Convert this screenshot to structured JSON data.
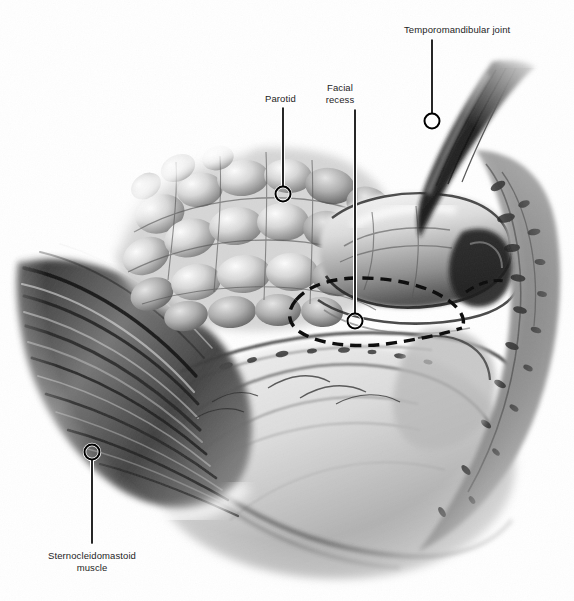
{
  "figure": {
    "style": "grayscale pencil medical illustration",
    "background_color": "#ffffff",
    "ink_color": "#1d1d1d",
    "width": 574,
    "height": 601
  },
  "labels": [
    {
      "id": "temporomandibular-joint",
      "text": "Temporomandibular joint",
      "text_x": 404,
      "text_y": 24,
      "text_align": "left",
      "leader": {
        "x1": 432,
        "y1": 40,
        "x2": 432,
        "y2": 113
      },
      "marker": {
        "cx": 432,
        "cy": 121,
        "r": 7.5
      }
    },
    {
      "id": "parotid",
      "text": "Parotid",
      "text_x": 265,
      "text_y": 93,
      "text_align": "left",
      "leader": {
        "x1": 283,
        "y1": 108,
        "x2": 283,
        "y2": 186
      },
      "marker": {
        "cx": 283,
        "cy": 194,
        "r": 7.5
      }
    },
    {
      "id": "facial-recess",
      "text": "Facial\nrecess",
      "text_x": 340,
      "text_y": 82,
      "text_align": "center",
      "leader": {
        "x1": 355,
        "y1": 110,
        "x2": 355,
        "y2": 313
      },
      "marker": {
        "cx": 355,
        "cy": 321,
        "r": 7.5
      }
    },
    {
      "id": "sternocleidomastoid-muscle",
      "text": "Sternocleidomastoid\nmuscle",
      "text_x": 92,
      "text_y": 550,
      "text_align": "center",
      "leader": {
        "x1": 92,
        "y1": 460,
        "x2": 92,
        "y2": 543
      },
      "marker": {
        "cx": 92,
        "cy": 452,
        "r": 7.5
      }
    }
  ],
  "marker_style": {
    "stroke": "#000000",
    "stroke_width": 2,
    "halo": "#ffffff",
    "halo_width": 2.5,
    "fill": "none"
  },
  "leader_style": {
    "stroke": "#000000",
    "stroke_width": 1.6,
    "halo": "#ffffff",
    "halo_width": 3
  },
  "anatomy_regions": [
    {
      "name": "parotid-gland-lobules",
      "description": "cobblestone lobulated gland, upper left-of-center"
    },
    {
      "name": "sternocleidomastoid-muscle",
      "description": "striated diagonal muscle fibers, lower left"
    },
    {
      "name": "mandibular-condyle-ramus",
      "description": "smooth rounded bone form, center-right"
    },
    {
      "name": "temporomandibular-joint-capsule",
      "description": "dark textured capsule, upper right"
    },
    {
      "name": "facial-recess-dashed-outline",
      "description": "dashed arc marking the facial recess"
    },
    {
      "name": "mastoid-tip-region",
      "description": "textured bone surface, right margin"
    },
    {
      "name": "submandibular-neck-soft-tissue",
      "description": "broad smooth sweep, lower center"
    }
  ]
}
